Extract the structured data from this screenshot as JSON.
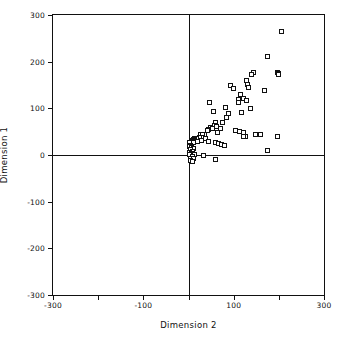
{
  "chart_data": {
    "type": "scatter",
    "title": "",
    "xlabel": "Dimension  2",
    "ylabel": "Dimension  1",
    "xlim": [
      -300,
      300
    ],
    "ylim": [
      -300,
      300
    ],
    "grid": false,
    "legend": null,
    "x_ticks": [
      -300,
      -200,
      -100,
      0,
      100,
      200,
      300
    ],
    "x_tick_labels": [
      "-300",
      "",
      "-100",
      "",
      "100",
      "",
      "300"
    ],
    "y_ticks": [
      -300,
      -200,
      -100,
      0,
      100,
      200,
      300
    ],
    "y_tick_labels": [
      "-300",
      "-200",
      "-100",
      "0",
      "100",
      "200",
      "300"
    ],
    "marker": "open-square",
    "marker_color": "#111111",
    "axis_color": "#111111",
    "reference_lines": {
      "x": 0,
      "y": 0
    },
    "points": [
      [
        207,
        265
      ],
      [
        176,
        212
      ],
      [
        196,
        176
      ],
      [
        200,
        175
      ],
      [
        199,
        172
      ],
      [
        144,
        176
      ],
      [
        140,
        172
      ],
      [
        128,
        159
      ],
      [
        131,
        152
      ],
      [
        132,
        144
      ],
      [
        169,
        139
      ],
      [
        92,
        150
      ],
      [
        99,
        143
      ],
      [
        116,
        130
      ],
      [
        122,
        121
      ],
      [
        110,
        119
      ],
      [
        128,
        116
      ],
      [
        110,
        113
      ],
      [
        46,
        112
      ],
      [
        82,
        102
      ],
      [
        138,
        100
      ],
      [
        118,
        92
      ],
      [
        56,
        93
      ],
      [
        88,
        90
      ],
      [
        85,
        80
      ],
      [
        76,
        70
      ],
      [
        60,
        69
      ],
      [
        58,
        63
      ],
      [
        63,
        61
      ],
      [
        49,
        58
      ],
      [
        53,
        57
      ],
      [
        71,
        57
      ],
      [
        45,
        54
      ],
      [
        41,
        53
      ],
      [
        104,
        53
      ],
      [
        113,
        51
      ],
      [
        121,
        48
      ],
      [
        64,
        48
      ],
      [
        36,
        45
      ],
      [
        26,
        44
      ],
      [
        30,
        43
      ],
      [
        148,
        44
      ],
      [
        159,
        44
      ],
      [
        127,
        40
      ],
      [
        122,
        39
      ],
      [
        32,
        38
      ],
      [
        24,
        37
      ],
      [
        196,
        40
      ],
      [
        18,
        36
      ],
      [
        14,
        35
      ],
      [
        38,
        35
      ],
      [
        12,
        33
      ],
      [
        28,
        32
      ],
      [
        8,
        31
      ],
      [
        16,
        30
      ],
      [
        21,
        29
      ],
      [
        6,
        29
      ],
      [
        44,
        28
      ],
      [
        10,
        27
      ],
      [
        3,
        26
      ],
      [
        60,
        27
      ],
      [
        66,
        24
      ],
      [
        73,
        22
      ],
      [
        80,
        21
      ],
      [
        5,
        21
      ],
      [
        2,
        18
      ],
      [
        7,
        16
      ],
      [
        12,
        14
      ],
      [
        4,
        11
      ],
      [
        175,
        10
      ],
      [
        9,
        8
      ],
      [
        2,
        6
      ],
      [
        6,
        3
      ],
      [
        14,
        2
      ],
      [
        3,
        1
      ],
      [
        34,
        0
      ],
      [
        8,
        -4
      ],
      [
        5,
        -7
      ],
      [
        11,
        -8
      ],
      [
        60,
        -10
      ],
      [
        4,
        -12
      ],
      [
        9,
        -14
      ]
    ]
  }
}
